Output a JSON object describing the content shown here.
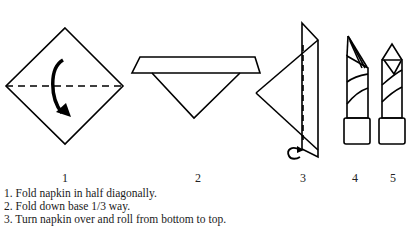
{
  "figure": {
    "steps": [
      {
        "number": "1",
        "shape": "diamond-with-dashed-diagonal-and-fold-arrow"
      },
      {
        "number": "2",
        "shape": "folded-triangle-with-band"
      },
      {
        "number": "3",
        "shape": "side-triangle-with-dashed-line-and-roll-arrow"
      },
      {
        "number": "4",
        "shape": "rolled-napkin-angled"
      },
      {
        "number": "5",
        "shape": "rolled-napkin-pointed"
      }
    ],
    "colors": {
      "stroke": "#000000",
      "background": "#ffffff"
    }
  },
  "instructions": [
    "1. Fold napkin in half diagonally.",
    "2. Fold down base 1/3 way.",
    "3. Turn napkin over and roll from bottom to top."
  ]
}
